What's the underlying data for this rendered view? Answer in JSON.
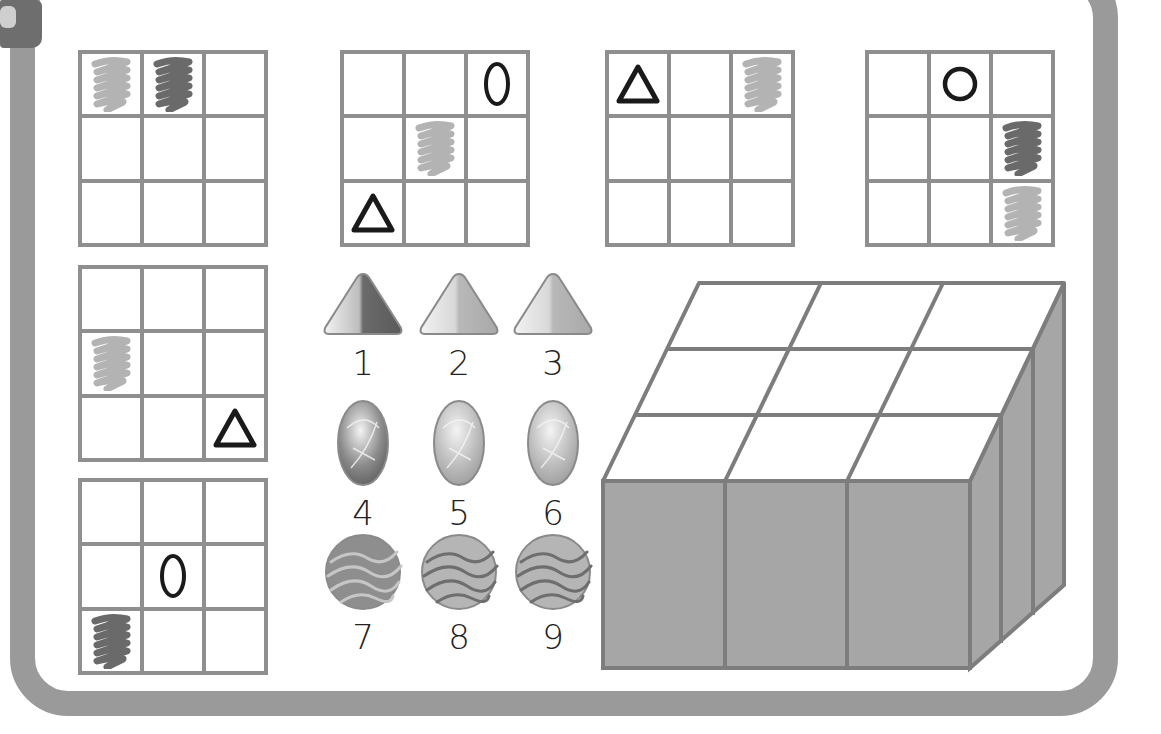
{
  "colors": {
    "frame": "#9a9a9a",
    "grid_line": "#8f8f8f",
    "scribble_light": "#b3b3b3",
    "scribble_dark": "#6a6a6a",
    "symbol": "#1a1a1a",
    "box_side": "#a6a6a6"
  },
  "grids": [
    {
      "id": "grid-1",
      "cells": [
        "scribble-light",
        "scribble-dark",
        "",
        "",
        "",
        "",
        "",
        "",
        ""
      ]
    },
    {
      "id": "grid-2",
      "cells": [
        "",
        "",
        "zero",
        "",
        "scribble-light",
        "",
        "triangle",
        "",
        ""
      ]
    },
    {
      "id": "grid-3",
      "cells": [
        "triangle",
        "",
        "scribble-light",
        "",
        "",
        "",
        "",
        "",
        ""
      ]
    },
    {
      "id": "grid-4",
      "cells": [
        "",
        "circle",
        "",
        "",
        "",
        "scribble-dark",
        "",
        "",
        "scribble-light"
      ]
    },
    {
      "id": "grid-5",
      "cells": [
        "",
        "",
        "",
        "scribble-light",
        "",
        "",
        "",
        "",
        "triangle"
      ]
    },
    {
      "id": "grid-6",
      "cells": [
        "",
        "",
        "",
        "",
        "zero",
        "",
        "scribble-dark",
        "",
        ""
      ]
    }
  ],
  "pieces": [
    {
      "number": "1",
      "shape": "triangle",
      "tone": "dark"
    },
    {
      "number": "2",
      "shape": "triangle",
      "tone": "light"
    },
    {
      "number": "3",
      "shape": "triangle",
      "tone": "light"
    },
    {
      "number": "4",
      "shape": "oval-gem",
      "tone": "dark"
    },
    {
      "number": "5",
      "shape": "oval-gem",
      "tone": "light"
    },
    {
      "number": "6",
      "shape": "oval-gem",
      "tone": "light"
    },
    {
      "number": "7",
      "shape": "wavy-ball",
      "tone": "dark"
    },
    {
      "number": "8",
      "shape": "wavy-ball",
      "tone": "light"
    },
    {
      "number": "9",
      "shape": "wavy-ball",
      "tone": "light"
    }
  ],
  "box": {
    "rows": 3,
    "cols": 3,
    "description": "3x3 open-top box target"
  }
}
